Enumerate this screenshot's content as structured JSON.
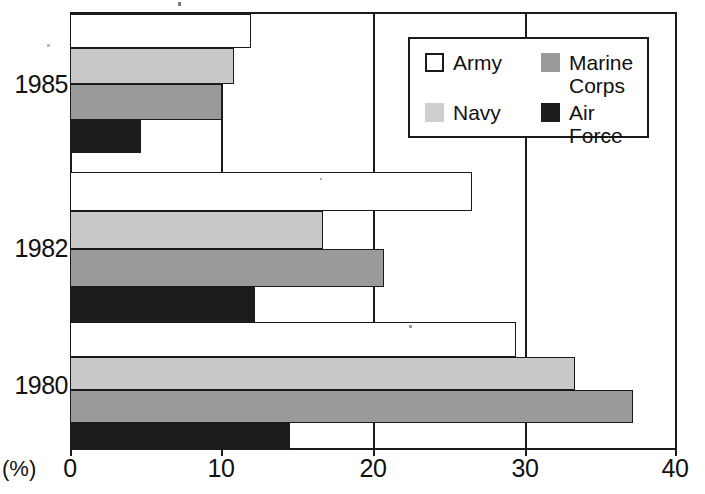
{
  "chart_data": {
    "type": "bar",
    "orientation": "horizontal",
    "title": "",
    "subtitle": "",
    "xlabel": "(%)",
    "ylabel": "",
    "xlim": [
      0,
      40
    ],
    "xticks": [
      0,
      10,
      20,
      30,
      40
    ],
    "xtick_labels": [
      "0",
      "10",
      "20",
      "30",
      "40"
    ],
    "categories": [
      "1985",
      "1982",
      "1980"
    ],
    "grid": true,
    "grid_axis": "x",
    "legend_position": "upper right",
    "series": [
      {
        "name": "Army",
        "color": "#ffffff",
        "values": [
          11.9,
          26.5,
          29.4
        ]
      },
      {
        "name": "Navy",
        "color": "#c9c9c9",
        "values": [
          10.8,
          16.7,
          33.3
        ]
      },
      {
        "name": "Marine Corps",
        "color": "#9a9a9a",
        "values": [
          10.0,
          20.7,
          37.1
        ]
      },
      {
        "name": "Air Force",
        "color": "#1c1c1c",
        "values": [
          4.7,
          12.2,
          14.5
        ]
      }
    ]
  },
  "axis": {
    "unit_label": "(%)",
    "x_tick_labels": [
      "0",
      "10",
      "20",
      "30",
      "40"
    ],
    "y_tick_labels": [
      "1985",
      "1982",
      "1980"
    ]
  },
  "legend": {
    "entries": [
      {
        "label": "Army",
        "swatch": "army-swatch"
      },
      {
        "label": "Marine\nCorps",
        "swatch": "marine-corps-swatch"
      },
      {
        "label": "Navy",
        "swatch": "navy-swatch"
      },
      {
        "label": "Air Force",
        "swatch": "air-force-swatch"
      }
    ]
  },
  "colors": {
    "army": "#ffffff",
    "navy": "#c9c9c9",
    "marine": "#9a9a9a",
    "airforce": "#1c1c1c",
    "outline": "#1a1a1a",
    "background": "#ffffff"
  }
}
